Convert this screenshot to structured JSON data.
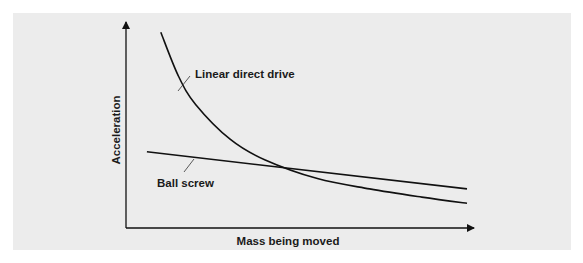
{
  "chart_data": {
    "type": "line",
    "title": "",
    "xlabel": "Mass being moved",
    "ylabel": "Acceleration",
    "xlim": [
      0,
      1
    ],
    "ylim": [
      0,
      1
    ],
    "grid": false,
    "legend": "none (inline annotations)",
    "series": [
      {
        "name": "Linear direct drive",
        "annotation": "Linear direct drive",
        "x": [
          0.1,
          0.15,
          0.2,
          0.3,
          0.4,
          0.55,
          0.7,
          0.85,
          0.98
        ],
        "y": [
          0.95,
          0.74,
          0.6,
          0.43,
          0.33,
          0.24,
          0.19,
          0.15,
          0.12
        ]
      },
      {
        "name": "Ball screw",
        "annotation": "Ball screw",
        "x": [
          0.06,
          0.98
        ],
        "y": [
          0.37,
          0.19
        ]
      }
    ],
    "annotations": [
      "Linear direct drive",
      "Ball screw"
    ]
  }
}
